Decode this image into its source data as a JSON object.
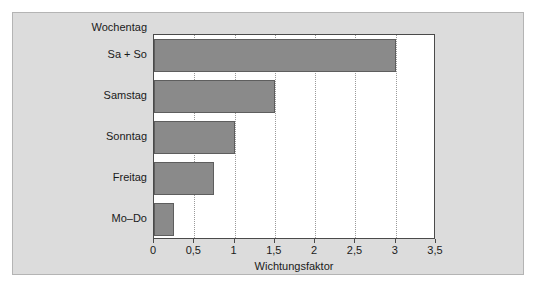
{
  "figure": {
    "background_color": "#dcdcdc",
    "plot_background_color": "#ffffff",
    "bar_color": "#8a8a8a",
    "bar_border_color": "#5e5e5e",
    "axis_color": "#4a4a4a",
    "gridline_color": "#9a9a9a"
  },
  "chart_data": {
    "type": "bar",
    "orientation": "horizontal",
    "title": "",
    "xlabel": "Wichtungsfaktor",
    "ylabel": "Wochentag",
    "categories": [
      "Sa + So",
      "Samstag",
      "Sonntag",
      "Freitag",
      "Mo–Do"
    ],
    "values": [
      3,
      1.5,
      1,
      0.75,
      0.25
    ],
    "series": [
      {
        "name": "Wichtungsfaktor",
        "values": [
          3,
          1.5,
          1,
          0.75,
          0.25
        ]
      }
    ],
    "xlim": [
      0,
      3.5
    ],
    "xticks": [
      0,
      0.5,
      1,
      1.5,
      2,
      2.5,
      3,
      3.5
    ],
    "xtick_labels": [
      "0",
      "0,5",
      "1",
      "1,5",
      "2",
      "2,5",
      "3",
      "3,5"
    ],
    "grid": "vertical-dotted",
    "legend": "none",
    "annotations": []
  }
}
